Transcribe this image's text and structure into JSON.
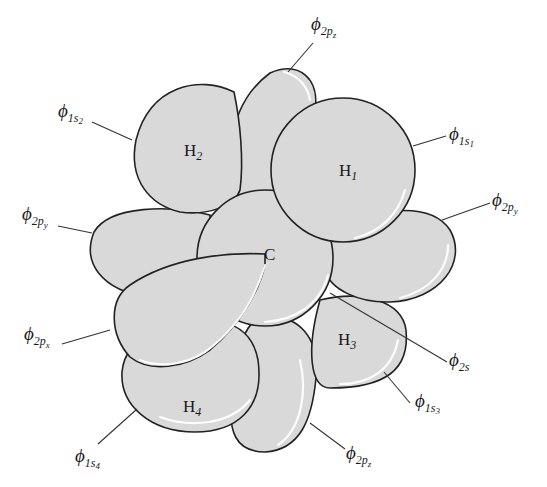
{
  "diagram": {
    "colors": {
      "orbital_fill": "#d9d9d9",
      "outline": "#222222",
      "highlight": "#ffffff"
    },
    "atoms": {
      "carbon": "C",
      "h1": {
        "base": "H",
        "sub": "1"
      },
      "h2": {
        "base": "H",
        "sub": "2"
      },
      "h3": {
        "base": "H",
        "sub": "3"
      },
      "h4": {
        "base": "H",
        "sub": "4"
      }
    },
    "labels": {
      "phi": "ϕ",
      "l_2pz_top": {
        "sub": "2p",
        "subsub": "z"
      },
      "l_1s2": {
        "sub": "1s",
        "subsub": "2"
      },
      "l_1s1": {
        "sub": "1s",
        "subsub": "1"
      },
      "l_2py_left": {
        "sub": "2p",
        "subsub": "y"
      },
      "l_2py_right": {
        "sub": "2p",
        "subsub": "y"
      },
      "l_2px": {
        "sub": "2p",
        "subsub": "x"
      },
      "l_2s": {
        "sub": "2s"
      },
      "l_1s3": {
        "sub": "1s",
        "subsub": "3"
      },
      "l_1s4": {
        "sub": "1s",
        "subsub": "4"
      },
      "l_2pz_bottom": {
        "sub": "2p",
        "subsub": "z"
      }
    }
  }
}
